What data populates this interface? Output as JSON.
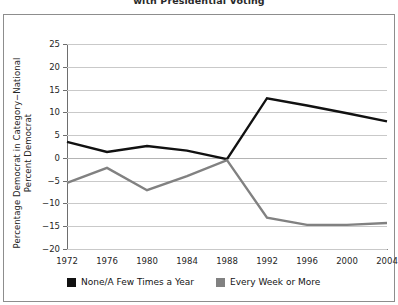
{
  "chart_data": {
    "type": "line",
    "title": "with Presidential Voting",
    "xlabel": "",
    "ylabel": "Percentage Democrat in Category−National Percent Democrat",
    "categories": [
      1972,
      1976,
      1980,
      1984,
      1988,
      1992,
      1996,
      2000,
      2004
    ],
    "xticklabels": [
      "1972",
      "1976",
      "1980",
      "1984",
      "1988",
      "1992",
      "1996",
      "2000",
      "2004"
    ],
    "yticklabels": [
      "25",
      "20",
      "15",
      "10",
      "5",
      "0",
      "−5",
      "−10",
      "−15",
      "−20"
    ],
    "yticks": [
      25,
      20,
      15,
      10,
      5,
      0,
      -5,
      -10,
      -15,
      -20
    ],
    "ylim": [
      -20,
      25
    ],
    "grid": true,
    "legend_position": "below-axes",
    "series": [
      {
        "name": "None/A Few Times a Year",
        "color": "#111111",
        "values": [
          3.5,
          1.3,
          2.6,
          1.6,
          -0.3,
          13.1,
          11.5,
          9.8,
          8.0
        ]
      },
      {
        "name": "Every Week or More",
        "color": "#818181",
        "values": [
          -5.5,
          -2.2,
          -7.1,
          -4.0,
          -0.5,
          -13.1,
          -14.7,
          -14.7,
          -14.3
        ]
      }
    ]
  },
  "legend": {
    "items": [
      {
        "label": "None/A Few Times a Year",
        "color": "#111111"
      },
      {
        "label": "Every Week or More",
        "color": "#818181"
      }
    ]
  }
}
